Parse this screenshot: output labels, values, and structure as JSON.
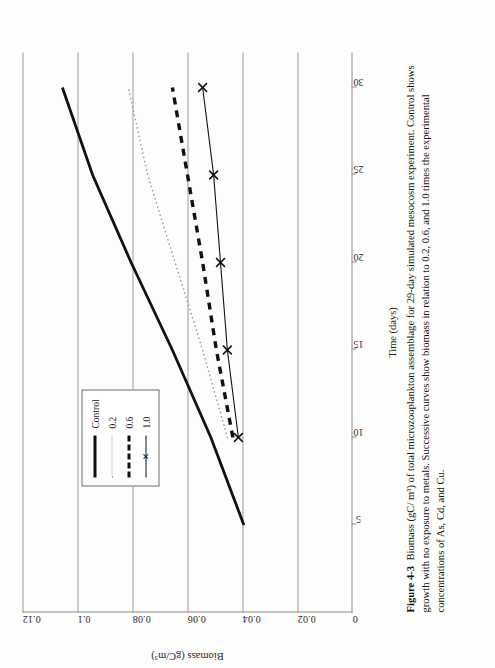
{
  "figure": {
    "caption_label": "Figure 4-3",
    "caption_text": "Biomass (gC/ m³) of total microzooplankton assemblage for 29-day simulated mesocosm experiment. Control shows growth with no exposure to metals.  Successive curves show biomass in relation to 0.2, 0.6, and 1.0 times the experimental concentrations of As, Cd, and Cu."
  },
  "chart_data": {
    "type": "line",
    "title": "",
    "xlabel": "Time (days)",
    "ylabel": "Biomass (gC/m³)",
    "xlim": [
      0,
      32
    ],
    "ylim": [
      0,
      0.12
    ],
    "xticks": [
      5,
      10,
      15,
      20,
      25,
      30
    ],
    "xtick_labels": [
      "5",
      "10",
      "15",
      "20",
      "25",
      "30"
    ],
    "yticks": [
      0,
      0.02,
      0.04,
      0.06,
      0.08,
      0.1,
      0.12
    ],
    "ytick_labels": [
      "0",
      "0.02",
      "0.04",
      "0.06",
      "0.08",
      "0.1",
      "0.12"
    ],
    "grid": "vertical-only",
    "legend_position": "left-middle",
    "series": [
      {
        "name": "Control",
        "style": "solid-thick",
        "color": "#111111",
        "x": [
          5,
          10,
          15,
          20,
          25,
          30
        ],
        "y": [
          0.0395,
          0.0515,
          0.0655,
          0.0805,
          0.0945,
          0.1055
        ]
      },
      {
        "name": "0.2",
        "style": "dotted",
        "color": "#9d9d9d",
        "x": [
          10,
          15,
          20,
          25,
          30
        ],
        "y": [
          0.0455,
          0.0545,
          0.0645,
          0.0745,
          0.0815
        ]
      },
      {
        "name": "0.6",
        "style": "dashed-thick",
        "color": "#111111",
        "x": [
          10,
          15,
          20,
          25,
          30
        ],
        "y": [
          0.0435,
          0.0495,
          0.0545,
          0.06,
          0.0655
        ]
      },
      {
        "name": "1.0",
        "style": "line-with-x-markers",
        "color": "#111111",
        "marker": "×",
        "x": [
          10,
          15,
          20,
          25,
          30
        ],
        "y": [
          0.0415,
          0.0455,
          0.048,
          0.0505,
          0.0545
        ]
      }
    ]
  },
  "legend": {
    "items": [
      {
        "label": "Control",
        "key": "solid-thick"
      },
      {
        "label": "0.2",
        "key": "dotted"
      },
      {
        "label": "0.6",
        "key": "dashed-thick"
      },
      {
        "label": "1.0",
        "key": "line-with-x-markers"
      }
    ]
  }
}
